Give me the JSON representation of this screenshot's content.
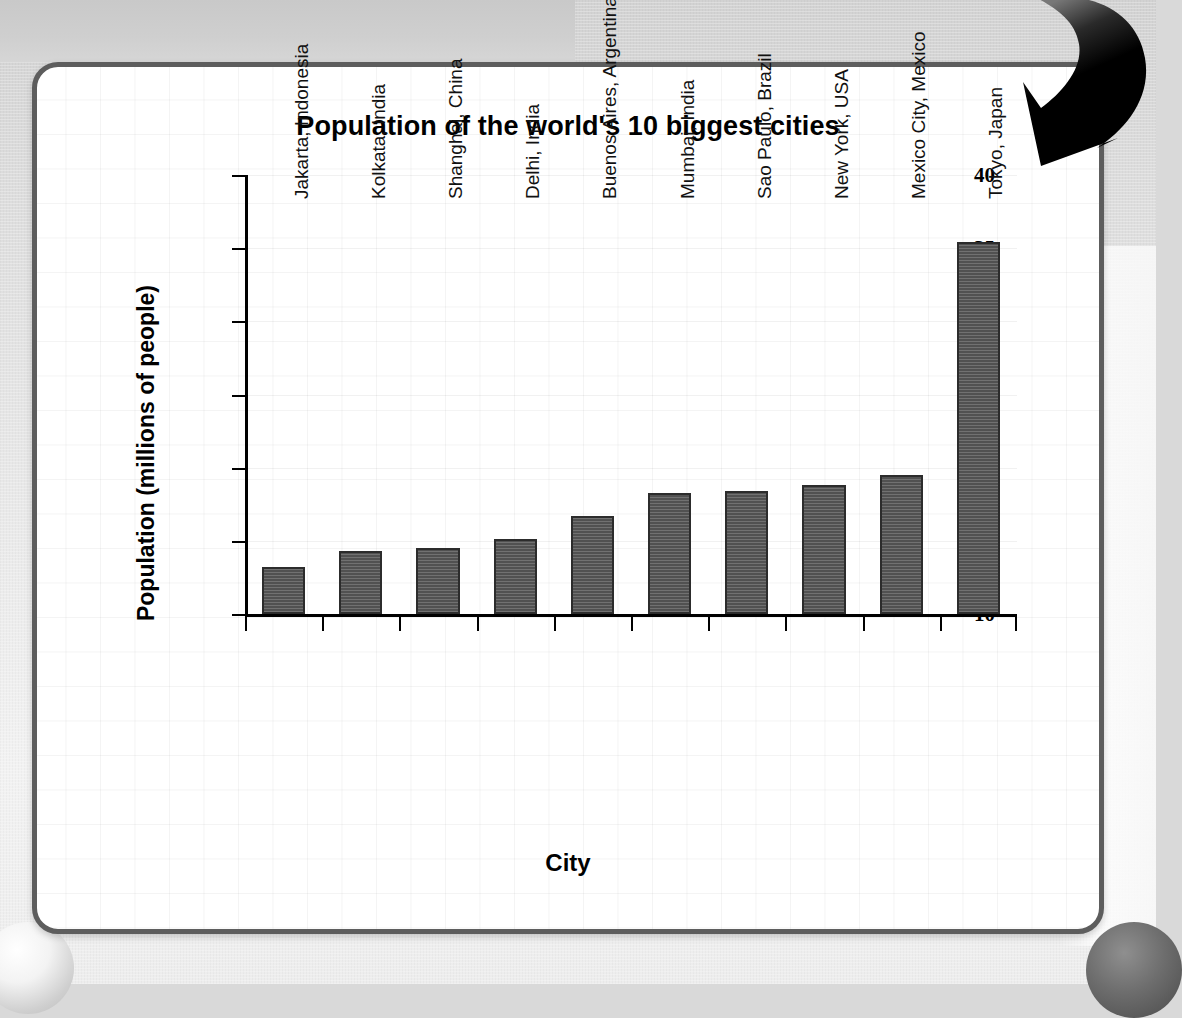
{
  "panel": {
    "title": "Population of the world's 10 biggest cities",
    "axis_label_x": "City",
    "axis_label_y": "Population (millions of people)"
  },
  "decorations": {
    "arrow": "curved-down-left-arrow",
    "arrow_color": "#000000",
    "panel_border_color": "#5d5d5d",
    "bar_color": "#5a5a5a",
    "bar_outline_color": "#2c2c2c",
    "page_background_color": "#e9e9e9"
  },
  "chart_data": {
    "type": "bar",
    "title": "Population of the world's 10 biggest cities",
    "xlabel": "City",
    "ylabel": "Population (millions of people)",
    "ylim": [
      10,
      40
    ],
    "yticks": [
      10,
      15,
      20,
      25,
      30,
      35,
      40
    ],
    "ytick_labels": [
      "10",
      "15",
      "20",
      "25",
      "30",
      "35",
      "40"
    ],
    "grid": true,
    "legend": "none",
    "categories": [
      "Jakarta, Indonesia",
      "Kolkata, India",
      "Shanghai, China",
      "Delhi, India",
      "Buenos Aires, Argentina",
      "Mumbai, India",
      "Sao Paulo, Brazil",
      "New York, USA",
      "Mexico City, Mexico",
      "Tokyo, Japan"
    ],
    "values": [
      13.2,
      14.3,
      14.5,
      15.1,
      16.7,
      18.3,
      18.4,
      18.8,
      19.5,
      35.4
    ]
  }
}
